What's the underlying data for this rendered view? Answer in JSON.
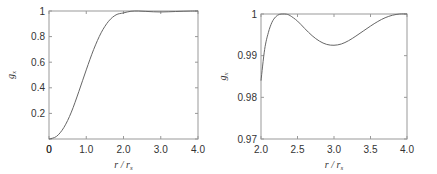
{
  "chart_data": [
    {
      "type": "line",
      "title": "",
      "xlabel": "r / r_s",
      "ylabel": "g_x",
      "xlim": [
        0,
        4.0
      ],
      "ylim": [
        0,
        1
      ],
      "x_ticks": [
        "0",
        "1.0",
        "2.0",
        "3.0",
        "4.0"
      ],
      "y_ticks": [
        "0.2",
        "0.4",
        "0.6",
        "0.8",
        "1"
      ],
      "grid": false,
      "series": [
        {
          "name": "g_x",
          "x": [
            0,
            0.2,
            0.4,
            0.6,
            0.8,
            1.0,
            1.2,
            1.4,
            1.6,
            1.8,
            2.0,
            2.2,
            2.4,
            2.6,
            2.8,
            3.0,
            3.2,
            3.4,
            3.6,
            3.8,
            4.0
          ],
          "y": [
            0.0,
            0.02,
            0.09,
            0.21,
            0.37,
            0.54,
            0.7,
            0.83,
            0.92,
            0.97,
            0.985,
            0.998,
            1.0,
            0.997,
            0.994,
            0.9925,
            0.994,
            0.996,
            0.998,
            0.9995,
            1.0
          ]
        }
      ]
    },
    {
      "type": "line",
      "title": "",
      "xlabel": "r / r_s",
      "ylabel": "g_x",
      "xlim": [
        2.0,
        4.0
      ],
      "ylim": [
        0.97,
        1
      ],
      "x_ticks": [
        "2.0",
        "2.5",
        "3.0",
        "3.5",
        "4.0"
      ],
      "y_ticks": [
        "0.97",
        "0.98",
        "0.99",
        "1"
      ],
      "grid": false,
      "series": [
        {
          "name": "g_x",
          "x": [
            2.0,
            2.05,
            2.1,
            2.15,
            2.2,
            2.25,
            2.3,
            2.35,
            2.4,
            2.5,
            2.6,
            2.7,
            2.8,
            2.9,
            3.0,
            3.1,
            3.2,
            3.3,
            3.4,
            3.5,
            3.6,
            3.7,
            3.8,
            3.9,
            4.0
          ],
          "y": [
            0.984,
            0.9915,
            0.9955,
            0.998,
            0.9993,
            0.9999,
            1.0,
            0.99995,
            0.9996,
            0.9983,
            0.9965,
            0.9948,
            0.9935,
            0.9927,
            0.9925,
            0.9928,
            0.9936,
            0.9947,
            0.9959,
            0.9971,
            0.9982,
            0.9991,
            0.9997,
            1.0,
            1.0
          ]
        }
      ]
    }
  ]
}
